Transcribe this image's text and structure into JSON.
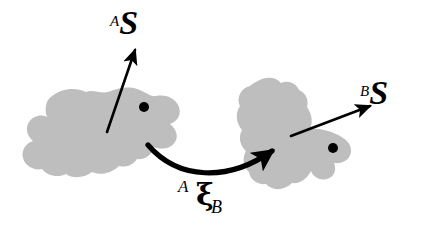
{
  "figure": {
    "width": 426,
    "height": 233,
    "background_color": "#ffffff",
    "blob_fill_color": "#bebebe",
    "stroke_color": "#000000"
  },
  "labels": {
    "frame_a": {
      "superscript": "A",
      "symbol": "S",
      "full_text": "AS",
      "x": 110,
      "y": 6
    },
    "frame_b": {
      "superscript": "B",
      "symbol": "S",
      "full_text": "BS",
      "x": 360,
      "y": 76
    },
    "transform": {
      "presuperscript": "A",
      "symbol": "ξ",
      "subscript": "B",
      "full_text": "AξB",
      "x": 178,
      "y": 178
    }
  },
  "shapes": {
    "blob_a": {
      "name": "object-a",
      "fill": "#bebebe",
      "bbox": [
        22,
        86,
        182,
        180
      ],
      "marker_dot": {
        "cx": 144,
        "cy": 107,
        "r": 5,
        "fill": "#000000"
      }
    },
    "blob_b": {
      "name": "object-b",
      "fill": "#bebebe",
      "bbox": [
        233,
        77,
        352,
        191
      ],
      "marker_dot": {
        "cx": 333,
        "cy": 148,
        "r": 5,
        "fill": "#000000"
      }
    }
  },
  "arrows": {
    "vector_a": {
      "name": "frame-a-vector",
      "from": [
        107,
        132
      ],
      "to": [
        136,
        48
      ],
      "stroke_width": 2.6,
      "color": "#000000"
    },
    "vector_b": {
      "name": "frame-b-vector",
      "from": [
        291,
        136
      ],
      "to": [
        372,
        105
      ],
      "stroke_width": 2.6,
      "color": "#000000"
    },
    "transform_arc": {
      "name": "transformation-arrow",
      "from": [
        148,
        146
      ],
      "control": [
        215,
        186
      ],
      "to": [
        275,
        148
      ],
      "stroke_width": 5.2,
      "color": "#000000"
    }
  },
  "chart_data": {
    "type": "diagram",
    "nodes": [
      {
        "id": "A",
        "label": "AS",
        "type": "object-blob",
        "center": [
          102,
          133
        ]
      },
      {
        "id": "B",
        "label": "BS",
        "type": "object-blob",
        "center": [
          292,
          134
        ]
      }
    ],
    "edges": [
      {
        "from": "A",
        "to": "B",
        "label": "AξB",
        "style": "curved-arrow"
      }
    ],
    "annotations": [
      {
        "text": "AS",
        "target": "A",
        "kind": "frame-vector"
      },
      {
        "text": "BS",
        "target": "B",
        "kind": "frame-vector"
      },
      {
        "text": "AξB",
        "target": "A->B",
        "kind": "transformation"
      }
    ]
  }
}
